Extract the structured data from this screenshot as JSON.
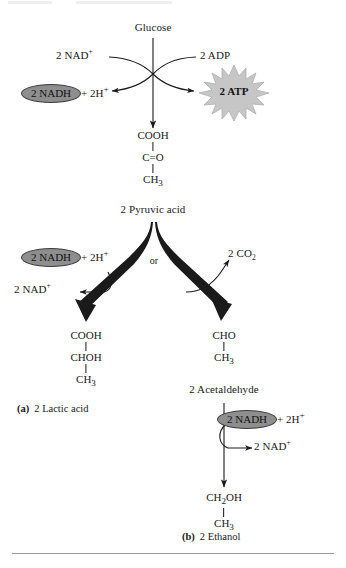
{
  "figure": {
    "start": {
      "label": "Glucose"
    },
    "glycolysis": {
      "nad_in": {
        "text": "2 NAD",
        "charge": "+"
      },
      "adp_in": {
        "text": "2 ADP"
      },
      "nadh_out": {
        "pill": "2 NADH",
        "tail": "+ 2H",
        "charge": "+"
      },
      "atp_out": {
        "text": "2 ATP"
      }
    },
    "pyruvate": {
      "formula": [
        "COOH",
        "C=O",
        "CH3"
      ],
      "formula_display": {
        "line1": "COOH",
        "line2": "C=O",
        "line3_main": "CH",
        "line3_sub": "3"
      },
      "label": "2 Pyruvic acid"
    },
    "branch": {
      "or_label": "or",
      "lactic": {
        "nadh_in": {
          "pill": "2 NADH",
          "tail": "+ 2H",
          "charge": "+"
        },
        "nad_out": {
          "text": "2 NAD",
          "charge": "+"
        },
        "formula_display": {
          "line1": "COOH",
          "line2": "CHOH",
          "line3_main": "CH",
          "line3_sub": "3"
        },
        "caption_tag": "(a)",
        "caption_text": "2 Lactic acid"
      },
      "alcoholic": {
        "co2_out": {
          "main": "2 CO",
          "sub": "2"
        },
        "acetaldehyde_formula": {
          "line1": "CHO",
          "line2_main": "CH",
          "line2_sub": "3"
        },
        "acetaldehyde_label": "2 Acetaldehyde",
        "nadh_in": {
          "pill": "2 NADH",
          "tail": "+ 2H",
          "charge": "+"
        },
        "nad_out": {
          "text": "2 NAD",
          "charge": "+"
        },
        "ethanol_formula": {
          "line1_main": "CH",
          "line1_sub": "2",
          "line1_rest": "OH",
          "line2_main": "CH",
          "line2_sub": "3"
        },
        "caption_tag": "(b)",
        "caption_text": "2 Ethanol"
      }
    },
    "colors": {
      "nadh_fill": "#8e8e8e",
      "nadh_stroke": "#3b3b3b",
      "atp_fill": "#c6c6c6",
      "atp_stroke": "#b0b0b0",
      "line": "#1a1a1a",
      "rule": "#9a9a9a",
      "background": "#ffffff"
    }
  }
}
